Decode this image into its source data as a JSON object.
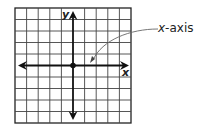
{
  "diagram": {
    "grid": {
      "cells_x": 10,
      "cells_y": 10
    },
    "axes": {
      "x_label": "x",
      "y_label": "y"
    },
    "origin_point": "origin",
    "callout": {
      "text": "x-axis",
      "italic_part": "x",
      "rest": "-axis"
    },
    "colors": {
      "line": "#222222",
      "grid": "#333333",
      "background": "#ffffff"
    }
  }
}
